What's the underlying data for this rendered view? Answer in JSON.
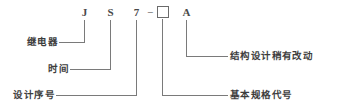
{
  "diagram": {
    "kind": "model-designation-breakdown",
    "model_code": "JS7-□A",
    "line_color": "#7a7a7a",
    "text_color": "#3d3d3d",
    "background_color": "#ffffff",
    "code_segments": [
      {
        "id": "seg-j",
        "label": "J",
        "type": "letter"
      },
      {
        "id": "seg-s",
        "label": "S",
        "type": "letter"
      },
      {
        "id": "seg-7",
        "label": "7",
        "type": "digit"
      },
      {
        "id": "seg-dash",
        "label": "−",
        "type": "separator"
      },
      {
        "id": "seg-box",
        "label": "",
        "type": "placeholder-box"
      },
      {
        "id": "seg-a",
        "label": "A",
        "type": "letter"
      }
    ],
    "callouts_left": [
      {
        "id": "callout-relay",
        "text": "继电器",
        "points_to": "J"
      },
      {
        "id": "callout-time",
        "text": "时间",
        "points_to": "S"
      },
      {
        "id": "callout-design-serial",
        "text": "设计序号",
        "points_to": "7"
      }
    ],
    "callouts_right": [
      {
        "id": "callout-structure-change",
        "text": "结构设计稍有改动",
        "points_to": "A"
      },
      {
        "id": "callout-basic-spec-code",
        "text": "基本规格代号",
        "points_to": "□"
      }
    ]
  }
}
